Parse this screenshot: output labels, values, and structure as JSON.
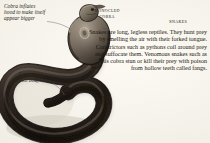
{
  "page": {
    "background_color": "#efece3",
    "ink_color": "#1d1a17"
  },
  "annotations": {
    "hood": "Cobra inflates\nhood to make itself\nappear bigger",
    "body": "Long,\nthin body"
  },
  "labels": {
    "specimen": "Monocled\nCobra",
    "section": "Snakes"
  },
  "body_copy": {
    "text": "Snakes are long, legless reptiles. They hunt prey by smelling the air with their forked tongue. Constrictors such as pythons coil around prey and suffocate them. Venomous snakes such as this cobra stun or kill their prey with poison from hollow teeth called fangs."
  },
  "artwork": {
    "subject": "monocled-cobra",
    "body_color": "#241c16",
    "hood_color": "#6d6255",
    "highlight_color": "#b6ab99"
  }
}
